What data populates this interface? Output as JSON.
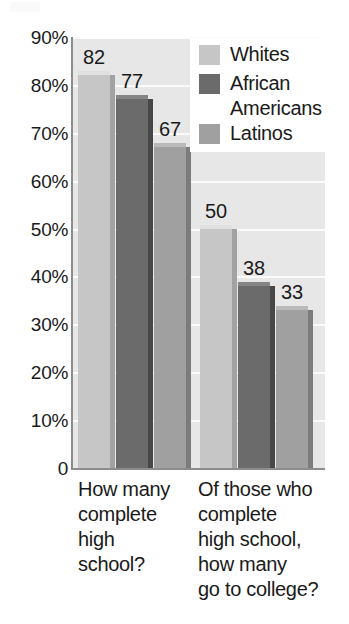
{
  "chart_data": {
    "type": "bar",
    "title": "",
    "subtitle": "",
    "xlabel": "",
    "ylabel": "",
    "ylim": [
      0,
      90
    ],
    "grid": true,
    "legend_position": "top-right",
    "y_ticks": [
      "90%",
      "80%",
      "70%",
      "60%",
      "50%",
      "40%",
      "30%",
      "20%",
      "10%",
      "0"
    ],
    "y_tick_values": [
      90,
      80,
      70,
      60,
      50,
      40,
      30,
      20,
      10,
      0
    ],
    "categories": [
      "How many\ncomplete\nhigh\nschool?",
      "Of those who\ncomplete\nhigh school,\nhow many\ngo to college?"
    ],
    "series": [
      {
        "name": "Whites",
        "values": [
          82,
          50
        ],
        "color": "#c6c6c6"
      },
      {
        "name": "African\nAmericans",
        "values": [
          77,
          38
        ],
        "color": "#6b6b6b"
      },
      {
        "name": "Latinos",
        "values": [
          67,
          33
        ],
        "color": "#a0a0a0"
      }
    ],
    "data_labels": [
      "82",
      "77",
      "67",
      "50",
      "38",
      "33"
    ],
    "plot_background": "#e7e7e7",
    "gridline_color": "#fbfbfb",
    "axis_color": "#8c8c8c",
    "text_color": "#1a1a1a",
    "legend_background": "#ffffff"
  }
}
